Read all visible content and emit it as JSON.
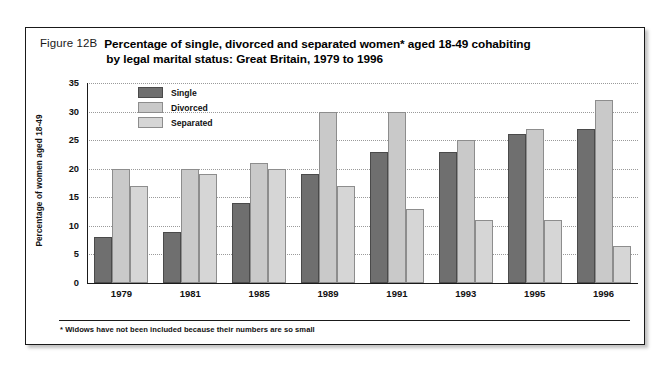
{
  "figure": {
    "number": "Figure 12B",
    "title_line1": "Percentage of single, divorced and separated women* aged 18-49 cohabiting",
    "title_line2": "by legal marital status: Great Britain, 1979 to 1996",
    "footnote": "* Widows have not been included because their numbers are so small",
    "corner_mark": ""
  },
  "colors": {
    "single": "#6f6f6f",
    "divorced": "#c9c9c9",
    "separated": "#d6d6d6",
    "axis": "#1a1a1a",
    "gridline": "#9a9a9a",
    "frame": "#1a1a1a"
  },
  "chart_data": {
    "type": "bar",
    "title": "Percentage of single, divorced and separated women* aged 18-49 cohabiting by legal marital status: Great Britain, 1979 to 1996",
    "xlabel": "",
    "ylabel": "Percentage of women aged 18-49",
    "ylim": [
      0,
      35
    ],
    "ytick_step": 5,
    "yticks": [
      0,
      5,
      10,
      15,
      20,
      25,
      30,
      35
    ],
    "grid": true,
    "legend_position": "top-left-inside",
    "categories": [
      "1979",
      "1981",
      "1985",
      "1989",
      "1991",
      "1993",
      "1995",
      "1996"
    ],
    "series": [
      {
        "name": "Single",
        "values": [
          8,
          9,
          14,
          19,
          23,
          23,
          26,
          27
        ]
      },
      {
        "name": "Divorced",
        "values": [
          20,
          20,
          21,
          30,
          30,
          25,
          27,
          32
        ]
      },
      {
        "name": "Separated",
        "values": [
          17,
          19,
          20,
          17,
          13,
          11,
          11,
          6.5
        ]
      }
    ]
  }
}
